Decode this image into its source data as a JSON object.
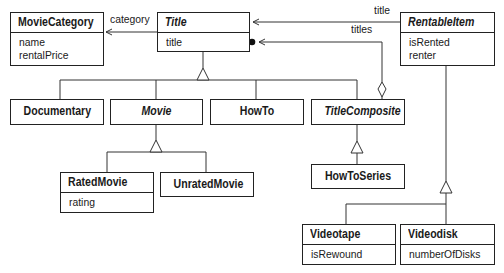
{
  "diagram": {
    "type": "uml-class-diagram",
    "classes": {
      "movie_category": {
        "name": "MovieCategory",
        "abstract": false,
        "attributes": [
          "name",
          "rentalPrice"
        ]
      },
      "title": {
        "name": "Title",
        "abstract": true,
        "attributes": [
          "title"
        ]
      },
      "rentable_item": {
        "name": "RentableItem",
        "abstract": true,
        "attributes": [
          "isRented",
          "renter"
        ]
      },
      "documentary": {
        "name": "Documentary",
        "abstract": false,
        "attributes": []
      },
      "movie": {
        "name": "Movie",
        "abstract": true,
        "attributes": []
      },
      "how_to": {
        "name": "HowTo",
        "abstract": false,
        "attributes": []
      },
      "title_composite": {
        "name": "TitleComposite",
        "abstract": true,
        "attributes": []
      },
      "how_to_series": {
        "name": "HowToSeries",
        "abstract": false,
        "attributes": []
      },
      "rated_movie": {
        "name": "RatedMovie",
        "abstract": false,
        "attributes": [
          "rating"
        ]
      },
      "unrated_movie": {
        "name": "UnratedMovie",
        "abstract": false,
        "attributes": []
      },
      "videotape": {
        "name": "Videotape",
        "abstract": false,
        "attributes": [
          "isRewound"
        ]
      },
      "videodisk": {
        "name": "Videodisk",
        "abstract": false,
        "attributes": [
          "numberOfDisks"
        ]
      }
    },
    "associations": [
      {
        "from": "Title",
        "to": "MovieCategory",
        "label": "category",
        "navigable_to": "MovieCategory"
      },
      {
        "from": "RentableItem",
        "to": "Title",
        "label": "title",
        "navigable_to": "Title"
      },
      {
        "from": "TitleComposite",
        "to": "Title",
        "label": "titles",
        "kind": "aggregation",
        "multiplicity_end": "many"
      }
    ],
    "generalizations": [
      {
        "parent": "Title",
        "children": [
          "Documentary",
          "Movie",
          "HowTo",
          "TitleComposite"
        ]
      },
      {
        "parent": "Movie",
        "children": [
          "RatedMovie",
          "UnratedMovie"
        ]
      },
      {
        "parent": "TitleComposite",
        "children": [
          "HowToSeries"
        ]
      },
      {
        "parent": "RentableItem",
        "children": [
          "Videotape",
          "Videodisk"
        ]
      }
    ]
  }
}
